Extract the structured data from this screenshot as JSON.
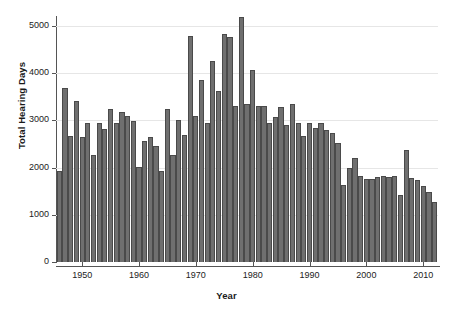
{
  "chart_data": {
    "type": "bar",
    "title": "",
    "subtitle": "",
    "xlabel": "Year",
    "ylabel": "Total Hearing Days",
    "xlim": [
      1945.4,
      2012.6
    ],
    "ylim": [
      0,
      5300
    ],
    "grid": true,
    "legend": null,
    "y_ticks": [
      0,
      1000,
      2000,
      3000,
      4000,
      5000
    ],
    "y_tick_labels": [
      "0",
      "1000",
      "2000",
      "3000",
      "4000",
      "5000"
    ],
    "x_ticks": [
      1950,
      1960,
      1970,
      1980,
      1990,
      2000,
      2010
    ],
    "x_tick_labels": [
      "1950",
      "1960",
      "1970",
      "1980",
      "1990",
      "2000",
      "2010"
    ],
    "bar_color": "#6f6f6f",
    "bar_edge_color": "#4a4a4a",
    "grid_color": "#e6e6e6",
    "axis_color": "#555555",
    "background": "#ffffff",
    "categories": [
      1946,
      1947,
      1948,
      1949,
      1950,
      1951,
      1952,
      1953,
      1954,
      1955,
      1956,
      1957,
      1958,
      1959,
      1960,
      1961,
      1962,
      1963,
      1964,
      1965,
      1966,
      1967,
      1968,
      1969,
      1970,
      1971,
      1972,
      1973,
      1974,
      1975,
      1976,
      1977,
      1978,
      1979,
      1980,
      1981,
      1982,
      1983,
      1984,
      1985,
      1986,
      1987,
      1988,
      1989,
      1990,
      1991,
      1992,
      1993,
      1994,
      1995,
      1996,
      1997,
      1998,
      1999,
      2000,
      2001,
      2002,
      2003,
      2004,
      2005,
      2006,
      2007,
      2008,
      2009,
      2010,
      2011,
      2012
    ],
    "values": [
      1930,
      3690,
      2670,
      3410,
      2660,
      2950,
      2270,
      2950,
      2820,
      3240,
      2950,
      3180,
      3100,
      3000,
      2010,
      2560,
      2660,
      2450,
      1940,
      3240,
      2270,
      3010,
      2690,
      4790,
      3090,
      3850,
      2950,
      4260,
      3620,
      4840,
      4780,
      3310,
      5200,
      3350,
      4080,
      3310,
      3300,
      2950,
      3080,
      3290,
      2900,
      3350,
      2940,
      2670,
      2950,
      2850,
      2940,
      2800,
      2740,
      2530,
      1630,
      1990,
      2200,
      1820,
      1760,
      1750,
      1810,
      1820,
      1800,
      1830,
      1420,
      2370,
      1790,
      1730,
      1620,
      1480,
      1270
    ]
  }
}
